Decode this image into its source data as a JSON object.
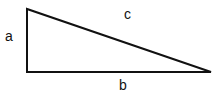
{
  "diagram": {
    "type": "right-triangle",
    "stroke_color": "#111111",
    "vertices": {
      "top_left": [
        27,
        9
      ],
      "bottom_left": [
        27,
        72
      ],
      "bottom_right": [
        211,
        72
      ]
    },
    "labels": {
      "a": "a",
      "b": "b",
      "c": "c"
    }
  }
}
